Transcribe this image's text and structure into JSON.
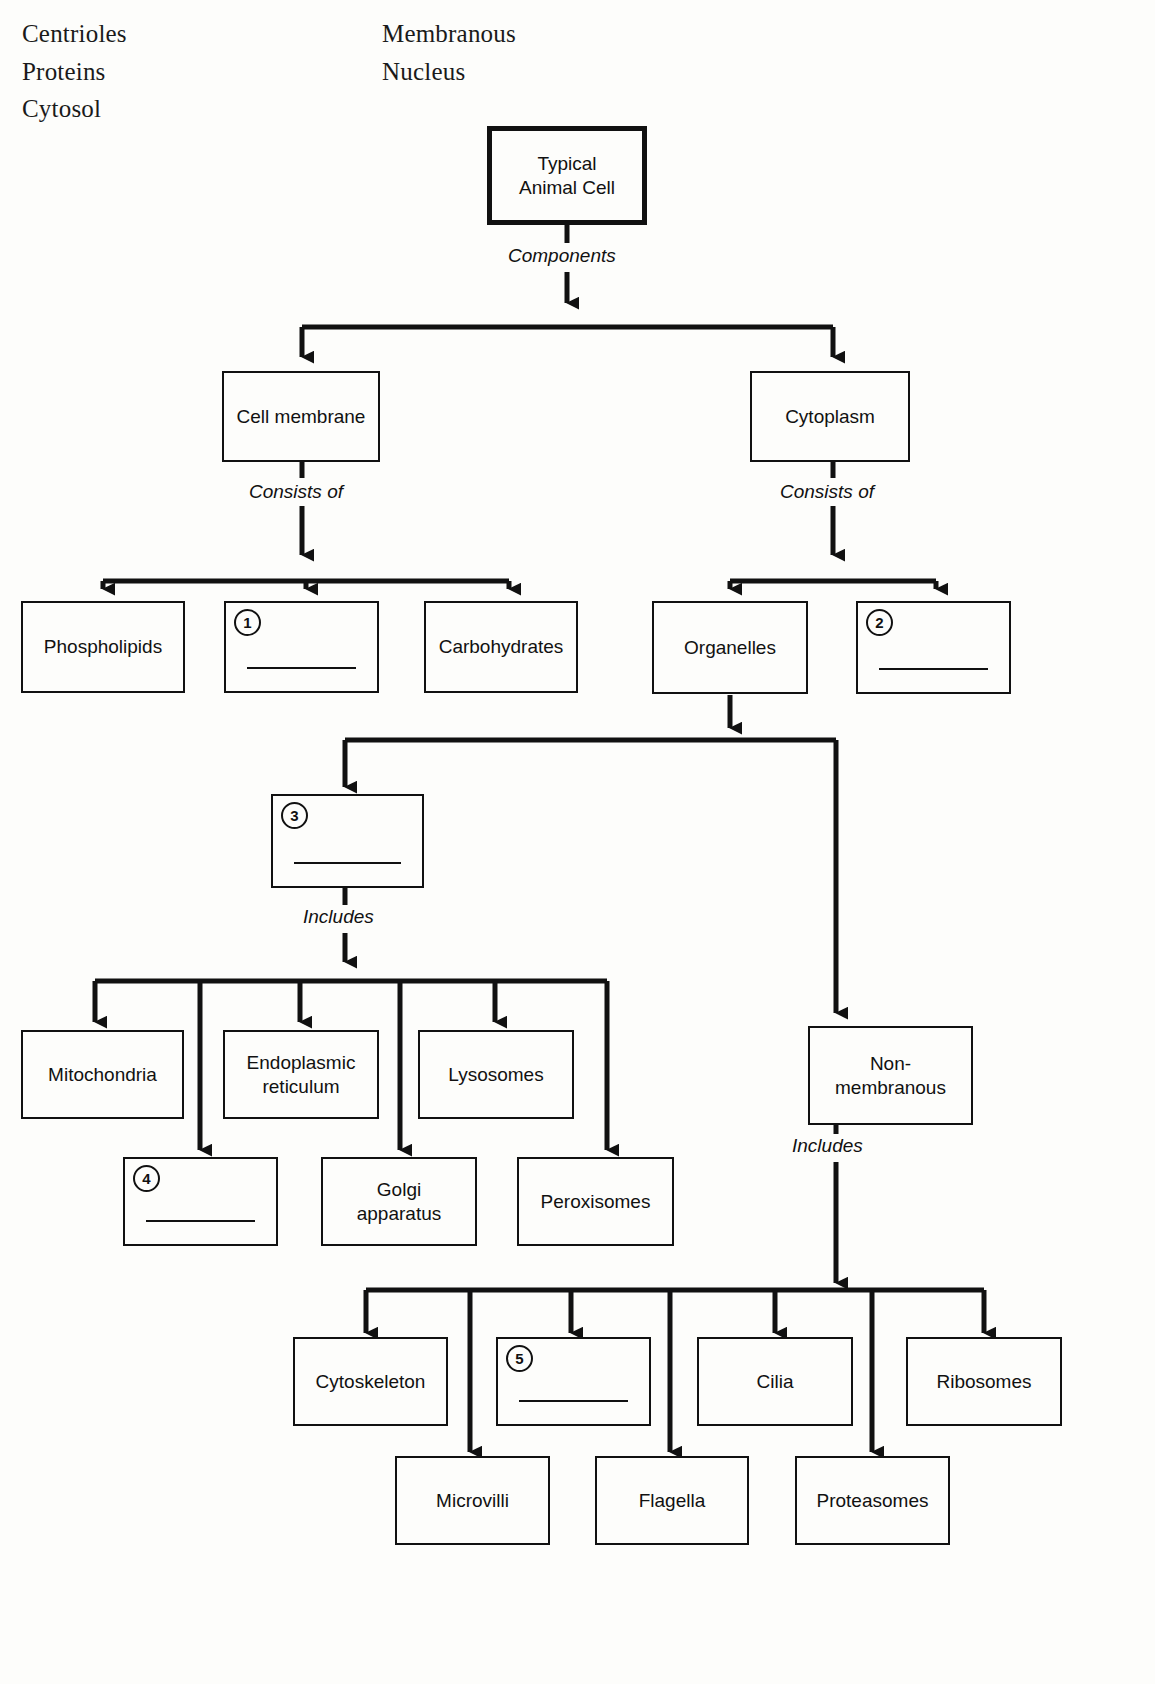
{
  "word_bank": {
    "column_1": [
      "Centrioles",
      "Proteins",
      "Cytosol"
    ],
    "column_2": [
      "Membranous",
      "Nucleus"
    ]
  },
  "diagram": {
    "root": {
      "label": "Typical\nAnimal Cell",
      "line1": "Typical",
      "line2": "Animal Cell"
    },
    "edge_labels": {
      "components": "Components",
      "consists_of_left": "Consists of",
      "consists_of_right": "Consists of",
      "includes_membranous": "Includes",
      "includes_nonmembranous": "Includes"
    },
    "nodes": {
      "cell_membrane": "Cell membrane",
      "cytoplasm": "Cytoplasm",
      "phospholipids": "Phospholipids",
      "carbohydrates": "Carbohydrates",
      "organelles": "Organelles",
      "non_membranous_l1": "Non-",
      "non_membranous_l2": "membranous",
      "mitochondria": "Mitochondria",
      "endoplasmic_l1": "Endoplasmic",
      "endoplasmic_l2": "reticulum",
      "lysosomes": "Lysosomes",
      "golgi_l1": "Golgi",
      "golgi_l2": "apparatus",
      "peroxisomes": "Peroxisomes",
      "cytoskeleton": "Cytoskeleton",
      "cilia": "Cilia",
      "ribosomes": "Ribosomes",
      "microvilli": "Microvilli",
      "flagella": "Flagella",
      "proteasomes": "Proteasomes"
    },
    "blanks": [
      {
        "number": "1"
      },
      {
        "number": "2"
      },
      {
        "number": "3"
      },
      {
        "number": "4"
      },
      {
        "number": "5"
      }
    ],
    "colors": {
      "ink": "#111111",
      "paper": "#fdfdfb"
    }
  }
}
